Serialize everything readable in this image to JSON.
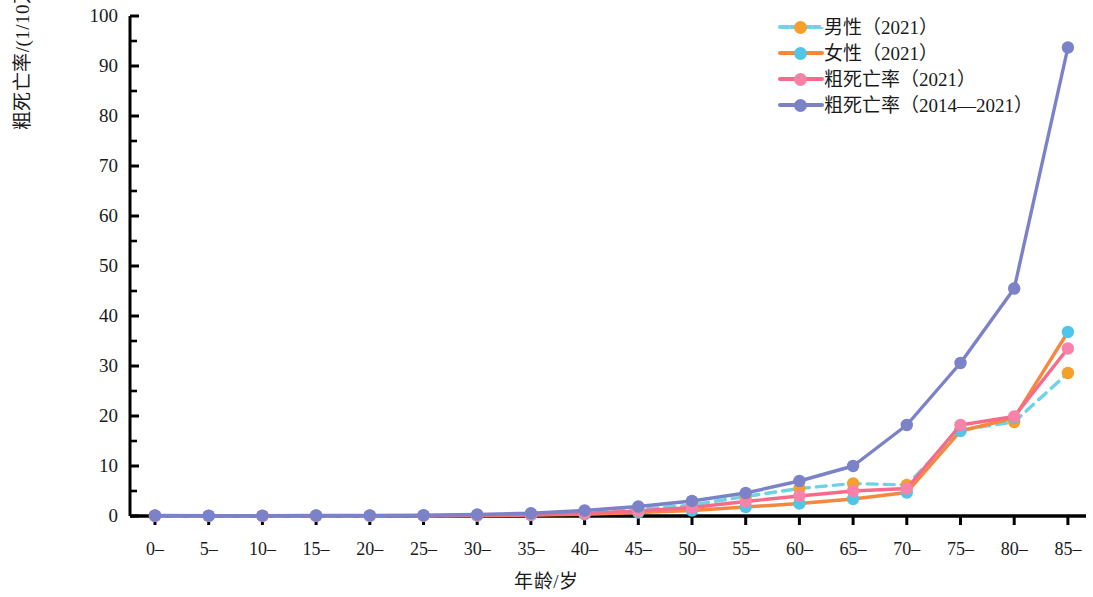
{
  "chart_data": {
    "type": "line",
    "title": "",
    "xlabel": "年龄/岁",
    "ylabel": "粗死亡率/(1/10万)",
    "categories": [
      "0–",
      "5–",
      "10–",
      "15–",
      "20–",
      "25–",
      "30–",
      "35–",
      "40–",
      "45–",
      "50–",
      "55–",
      "60–",
      "65–",
      "70–",
      "75–",
      "80–",
      "85–"
    ],
    "ylim": [
      0,
      100
    ],
    "ytick_labels": [
      "0",
      "10",
      "20",
      "30",
      "40",
      "50",
      "60",
      "70",
      "80",
      "90",
      "100"
    ],
    "ytick_step": 10,
    "yminor_step": 5,
    "grid": "off",
    "legend_position": "top-right",
    "series": [
      {
        "name": "男性（2021）",
        "color": "#6fd3e8",
        "marker_color": "#f5a02a",
        "dash": "dashed",
        "values": [
          0.05,
          0.03,
          0.03,
          0.05,
          0.06,
          0.08,
          0.15,
          0.3,
          0.6,
          1.3,
          2.2,
          3.9,
          5.5,
          6.5,
          6.2,
          17.2,
          18.8,
          28.6
        ]
      },
      {
        "name": "女性（2021）",
        "color": "#f5883c",
        "marker_color": "#4fc6e8",
        "dash": "solid",
        "values": [
          0.05,
          0.03,
          0.03,
          0.04,
          0.05,
          0.06,
          0.1,
          0.2,
          0.35,
          0.7,
          1.1,
          1.8,
          2.5,
          3.4,
          4.7,
          17.0,
          19.6,
          36.8
        ]
      },
      {
        "name": "粗死亡率（2021）",
        "color": "#f76b8a",
        "marker_color": "#f982a8",
        "dash": "solid",
        "values": [
          0.05,
          0.03,
          0.03,
          0.05,
          0.06,
          0.07,
          0.12,
          0.25,
          0.5,
          1.0,
          1.7,
          2.9,
          4.0,
          5.0,
          5.5,
          18.2,
          19.9,
          33.5
        ]
      },
      {
        "name": "粗死亡率（2014—2021）",
        "color": "#7b82c8",
        "marker_color": "#7b82c8",
        "dash": "solid",
        "values": [
          0.1,
          0.08,
          0.08,
          0.1,
          0.12,
          0.15,
          0.3,
          0.55,
          1.1,
          1.9,
          3.0,
          4.6,
          7.0,
          10.0,
          18.2,
          30.6,
          45.5,
          93.7
        ]
      }
    ]
  },
  "axis": {
    "y_axis_name": "y-axis",
    "x_axis_name": "x-axis"
  }
}
